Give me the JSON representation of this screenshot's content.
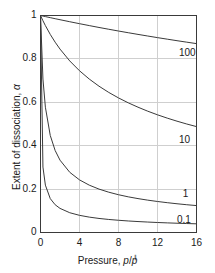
{
  "chart_data": {
    "type": "line",
    "title": "",
    "xlabel": "Pressure, p/p°",
    "ylabel": "Extent of dissociation, α",
    "xlim": [
      0,
      16
    ],
    "ylim": [
      0,
      1
    ],
    "xticks": [
      "0",
      "4",
      "8",
      "12",
      "16"
    ],
    "xtick_values": [
      0,
      4,
      8,
      12,
      16
    ],
    "yticks": [
      "0",
      "0.2",
      "0.4",
      "0.6",
      "0.8",
      "1"
    ],
    "ytick_values": [
      0,
      0.2,
      0.4,
      0.6,
      0.8,
      1
    ],
    "grid": true,
    "legend_position": "inline-right-end-of-curve",
    "line_color": "#3a3a3a",
    "grid_color": "#cfcfcf",
    "frame_color": "#3a3a3a",
    "x": [
      0,
      0.25,
      0.5,
      1,
      1.5,
      2,
      3,
      4,
      5,
      6,
      7,
      8,
      9,
      10,
      11,
      12,
      13,
      14,
      15,
      16
    ],
    "series": [
      {
        "name": "100",
        "label": "100",
        "K": 100,
        "values": [
          1,
          0.9975,
          0.995,
          0.9901,
          0.9853,
          0.9806,
          0.9713,
          0.9623,
          0.9535,
          0.9449,
          0.9366,
          0.9285,
          0.9206,
          0.9129,
          0.9054,
          0.898,
          0.8909,
          0.8839,
          0.8771,
          0.8704
        ],
        "label_x": 14.2,
        "label_y": 0.825
      },
      {
        "name": "10",
        "label": "10",
        "K": 10,
        "values": [
          1,
          0.9759,
          0.9535,
          0.9129,
          0.8771,
          0.8452,
          0.7906,
          0.7454,
          0.7071,
          0.6742,
          0.6455,
          0.6202,
          0.5976,
          0.5774,
          0.559,
          0.5423,
          0.527,
          0.513,
          0.5,
          0.488
        ],
        "label_x": 14.2,
        "label_y": 0.425
      },
      {
        "name": "1",
        "label": "1",
        "K": 1,
        "values": [
          1,
          0.7071,
          0.5774,
          0.4472,
          0.378,
          0.3333,
          0.2774,
          0.2425,
          0.2182,
          0.2,
          0.1857,
          0.1741,
          0.1644,
          0.1562,
          0.1491,
          0.1429,
          0.1374,
          0.1325,
          0.128,
          0.124
        ],
        "label_x": 14.6,
        "label_y": 0.175
      },
      {
        "name": "0.1",
        "label": "0.1",
        "K": 0.1,
        "values": [
          1,
          0.3015,
          0.2182,
          0.1562,
          0.128,
          0.1111,
          0.0911,
          0.0791,
          0.0709,
          0.0648,
          0.0601,
          0.0563,
          0.0531,
          0.0504,
          0.0481,
          0.0461,
          0.0443,
          0.0427,
          0.0413,
          0.04
        ],
        "label_x": 14.0,
        "label_y": 0.055
      }
    ]
  },
  "axis": {
    "ylabel_prefix": "Extent of dissociation, ",
    "ylabel_symbol": "α",
    "xlabel_prefix": "Pressure, ",
    "xlabel_num": "p",
    "xlabel_slash": "/",
    "xlabel_den": "p",
    "xlabel_sup": "⃦"
  }
}
